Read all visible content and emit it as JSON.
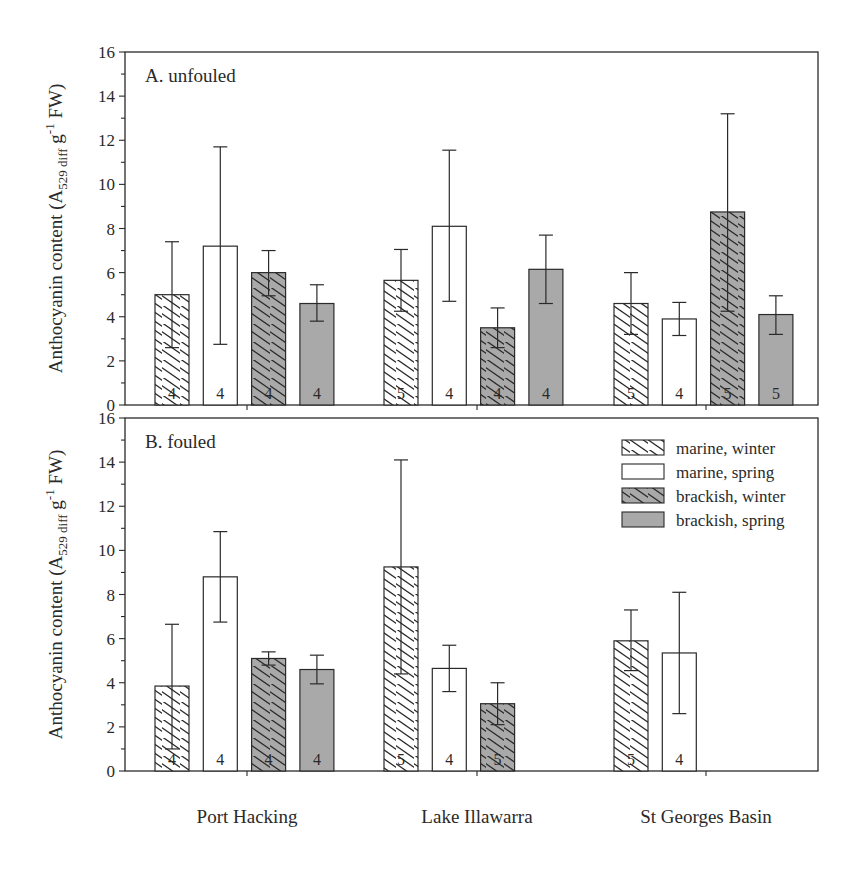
{
  "chart_data": [
    {
      "type": "bar",
      "panel": "A",
      "title": "A. unfouled",
      "ylabel": "Anthocyanin content (A529 diff g-1 FW)",
      "ylabel_parts": {
        "main": "Anthocyanin content (A",
        "sub": "529 diff",
        "mid": " g",
        "sup": "-1",
        "end": " FW)"
      },
      "ylim": [
        0,
        16
      ],
      "yticks": [
        0,
        2,
        4,
        6,
        8,
        10,
        12,
        14,
        16
      ],
      "grid": false,
      "categories": [
        "Port Hacking",
        "Lake Illawarra",
        "St Georges Basin"
      ],
      "series": [
        {
          "name": "marine, winter",
          "values": [
            5.0,
            5.65,
            4.6
          ],
          "err_low": [
            2.6,
            4.25,
            3.2
          ],
          "err_high": [
            7.4,
            7.05,
            6.0
          ],
          "n": [
            4,
            5,
            5
          ]
        },
        {
          "name": "marine, spring",
          "values": [
            7.2,
            8.1,
            3.9
          ],
          "err_low": [
            2.75,
            4.7,
            3.15
          ],
          "err_high": [
            11.7,
            11.55,
            4.65
          ],
          "n": [
            4,
            4,
            4
          ]
        },
        {
          "name": "brackish, winter",
          "values": [
            6.0,
            3.5,
            8.75
          ],
          "err_low": [
            4.95,
            2.6,
            4.25
          ],
          "err_high": [
            7.0,
            4.4,
            13.2
          ],
          "n": [
            4,
            4,
            5
          ]
        },
        {
          "name": "brackish, spring",
          "values": [
            4.6,
            6.15,
            4.1
          ],
          "err_low": [
            3.8,
            4.6,
            3.2
          ],
          "err_high": [
            5.45,
            7.7,
            4.95
          ],
          "n": [
            4,
            4,
            5
          ]
        }
      ]
    },
    {
      "type": "bar",
      "panel": "B",
      "title": "B. fouled",
      "ylabel": "Anthocyanin content (A529 diff g-1 FW)",
      "ylabel_parts": {
        "main": "Anthocyanin content (A",
        "sub": "529 diff",
        "mid": " g",
        "sup": "-1",
        "end": " FW)"
      },
      "ylim": [
        0,
        16
      ],
      "yticks": [
        0,
        2,
        4,
        6,
        8,
        10,
        12,
        14,
        16
      ],
      "grid": false,
      "legend_position": "upper right",
      "categories": [
        "Port Hacking",
        "Lake Illawarra",
        "St Georges Basin"
      ],
      "series": [
        {
          "name": "marine, winter",
          "values": [
            3.85,
            9.25,
            5.9
          ],
          "err_low": [
            1.0,
            4.4,
            4.55
          ],
          "err_high": [
            6.65,
            14.1,
            7.3
          ],
          "n": [
            4,
            5,
            5
          ]
        },
        {
          "name": "marine, spring",
          "values": [
            8.8,
            4.65,
            5.35
          ],
          "err_low": [
            6.75,
            3.6,
            2.6
          ],
          "err_high": [
            10.85,
            5.7,
            8.1
          ],
          "n": [
            4,
            4,
            4
          ]
        },
        {
          "name": "brackish, winter",
          "values": [
            5.1,
            3.05,
            null
          ],
          "err_low": [
            4.8,
            2.1,
            null
          ],
          "err_high": [
            5.4,
            4.0,
            null
          ],
          "n": [
            4,
            5,
            null
          ]
        },
        {
          "name": "brackish, spring",
          "values": [
            4.6,
            null,
            null
          ],
          "err_low": [
            3.95,
            null,
            null
          ],
          "err_high": [
            5.25,
            null,
            null
          ],
          "n": [
            4,
            null,
            null
          ]
        }
      ]
    }
  ],
  "legend": [
    {
      "label": "marine, winter",
      "fill": "#ffffff",
      "hatch": true
    },
    {
      "label": "marine, spring",
      "fill": "#ffffff",
      "hatch": false
    },
    {
      "label": "brackish, winter",
      "fill": "#a9a9a9",
      "hatch": true
    },
    {
      "label": "brackish, spring",
      "fill": "#a9a9a9",
      "hatch": false
    }
  ],
  "colors": {
    "axis": "#2a2a2a",
    "brackish_fill": "#a9a9a9",
    "marine_fill": "#ffffff"
  }
}
